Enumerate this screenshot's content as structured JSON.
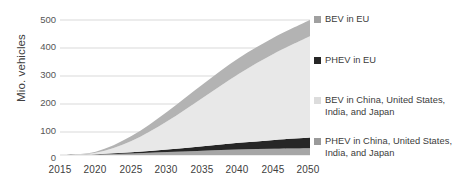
{
  "chart_data": {
    "type": "area",
    "title": "",
    "subtitle": "",
    "xlabel": "",
    "ylabel": "Mio. vehicles",
    "stacked": true,
    "grid": true,
    "legend_position": "right",
    "xlim": [
      2015,
      2050
    ],
    "ylim": [
      0,
      500
    ],
    "xticks": [
      "2015",
      "2020",
      "2025",
      "2030",
      "2035",
      "2040",
      "2045",
      "2050"
    ],
    "yticks": [
      "0",
      "100",
      "200",
      "300",
      "400",
      "500"
    ],
    "x": [
      2015,
      2020,
      2025,
      2030,
      2035,
      2040,
      2045,
      2050
    ],
    "series": [
      {
        "name": "PHEV in China, United States, India, and Japan",
        "color": "#a6a6a6",
        "stack_order": 1,
        "values": [
          0,
          2,
          6,
          11,
          16,
          20,
          23,
          25
        ]
      },
      {
        "name": "PHEV in EU",
        "color": "#262626",
        "stack_order": 2,
        "values": [
          0,
          1,
          4,
          9,
          16,
          25,
          33,
          40
        ]
      },
      {
        "name": "BEV in China, United States, India, and Japan",
        "color": "#e8e8e8",
        "stack_order": 3,
        "values": [
          0,
          5,
          42,
          105,
          180,
          255,
          320,
          375
        ]
      },
      {
        "name": "BEV in EU",
        "color": "#b3b3b3",
        "stack_order": 4,
        "values": [
          0,
          4,
          18,
          35,
          50,
          58,
          60,
          60
        ]
      }
    ],
    "legend": [
      {
        "label": "BEV in EU",
        "color": "#a0a0a0"
      },
      {
        "label": "PHEV in EU",
        "color": "#262626"
      },
      {
        "label": "BEV in China, United States, India, and Japan",
        "color": "#dcdcdc"
      },
      {
        "label": "PHEV in China, United States, India, and Japan",
        "color": "#9a9a9a"
      }
    ],
    "colors": {
      "gridline": "#d9d9d9",
      "axis_text": "#404040",
      "background": "#ffffff"
    }
  }
}
